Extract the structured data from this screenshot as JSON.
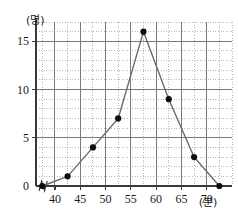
{
  "chart_data": {
    "type": "line",
    "title": "",
    "subtitle": "",
    "xlabel": "(분)",
    "ylabel": "(명)",
    "xlim": [
      36.25,
      75.0
    ],
    "ylim": [
      0,
      17
    ],
    "grid": true,
    "legend": false,
    "legend_position": "none",
    "x": [
      37.5,
      42.5,
      47.5,
      52.5,
      57.5,
      62.5,
      67.5,
      72.5
    ],
    "values": [
      0,
      1,
      4,
      7,
      16,
      9,
      3,
      0
    ],
    "series": [
      {
        "name": "도수분포다각형",
        "values": [
          0,
          1,
          4,
          7,
          16,
          9,
          3,
          0
        ]
      }
    ],
    "x_tick_labels": [
      "40",
      "45",
      "50",
      "55",
      "60",
      "65",
      "70"
    ],
    "x_tick_values": [
      40,
      45,
      50,
      55,
      60,
      65,
      70
    ],
    "y_tick_labels": [
      "0",
      "5",
      "10",
      "15"
    ],
    "y_tick_values": [
      0,
      5,
      10,
      15
    ],
    "x_minor_step": 2.5,
    "y_minor_step": 1,
    "axis_break": true,
    "marker_color": "#0d0d0d",
    "line_color": "#6b6b6b",
    "grid_major_color": "#7a7a7a",
    "grid_minor_color": "#9a9a9a",
    "axis_color": "#3a3a3a",
    "background_color": "#ffffff"
  },
  "axes": {
    "y_unit_label": "(명)",
    "x_unit_label": "(분)",
    "origin_label": "0"
  }
}
